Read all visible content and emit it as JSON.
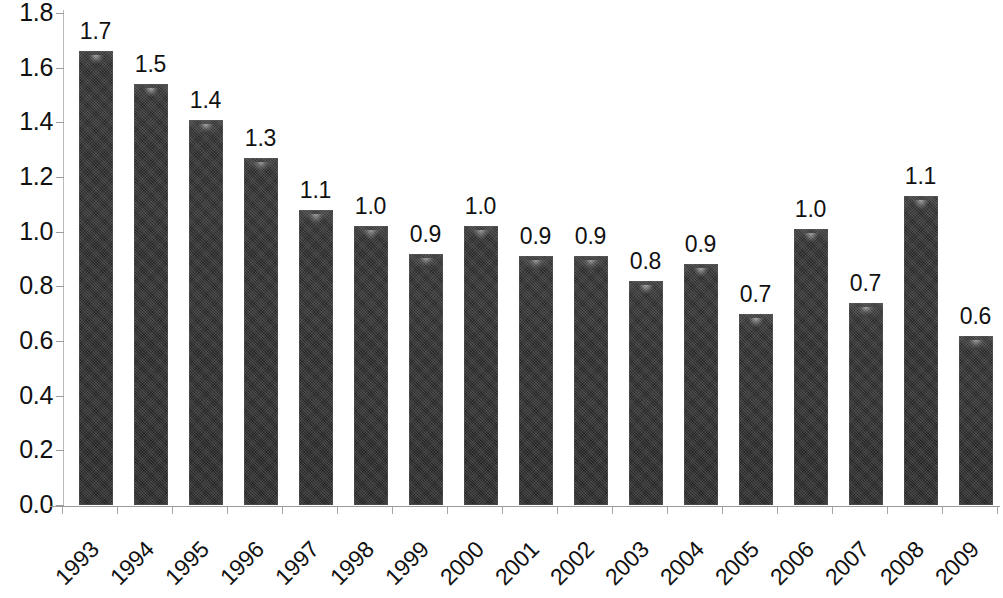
{
  "chart_data": {
    "type": "bar",
    "title": "",
    "subtitle": "",
    "xlabel": "",
    "ylabel": "",
    "grid": false,
    "legend": false,
    "ylim": [
      0.0,
      1.8
    ],
    "ytick_step": 0.2,
    "ytick_labels": [
      "1.8",
      "1.6",
      "1.4",
      "1.2",
      "1.0",
      "0.8",
      "0.6",
      "0.4",
      "0.2",
      "0.0"
    ],
    "ytick_values": [
      1.8,
      1.6,
      1.4,
      1.2,
      1.0,
      0.8,
      0.6,
      0.4,
      0.2,
      0.0
    ],
    "categories": [
      "1993",
      "1994",
      "1995",
      "1996",
      "1997",
      "1998",
      "1999",
      "2000",
      "2001",
      "2002",
      "2003",
      "2004",
      "2005",
      "2006",
      "2007",
      "2008",
      "2009"
    ],
    "values": [
      1.66,
      1.54,
      1.41,
      1.27,
      1.08,
      1.02,
      0.92,
      1.02,
      0.91,
      0.91,
      0.82,
      0.88,
      0.7,
      1.01,
      0.74,
      1.13,
      0.62
    ],
    "data_labels": [
      "1.7",
      "1.5",
      "1.4",
      "1.3",
      "1.1",
      "1.0",
      "0.9",
      "1.0",
      "0.9",
      "0.9",
      "0.8",
      "0.9",
      "0.7",
      "1.0",
      "0.7",
      "1.1",
      "0.6"
    ],
    "bar_color": "#262626",
    "axis_color": "#9a9a9a",
    "text_color": "#111111",
    "background_color": "#ffffff",
    "xtick_rotation_degrees": -45
  }
}
